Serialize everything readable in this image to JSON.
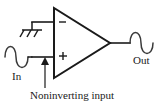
{
  "figure": {
    "background_color": "#ffffff",
    "line_color": "#1a1a1a",
    "waveform_color": "#3a3a3a"
  },
  "labels": {
    "input": "In",
    "output": "Out",
    "callout": "Noninverting input"
  },
  "opamp": {
    "inverting_pin_symbol": "−",
    "noninverting_pin_symbol": "+",
    "shape": "triangle"
  },
  "symbols": {
    "ground": "chassis-ground",
    "input_source": "sine-wave",
    "output_signal": "sine-wave",
    "callout_pointer": "arrow-up"
  }
}
